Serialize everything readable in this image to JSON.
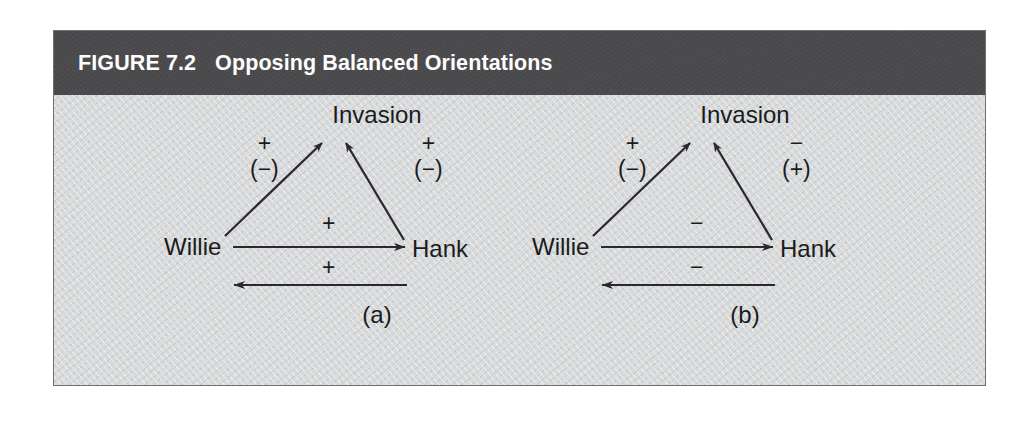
{
  "figure": {
    "number_label": "FIGURE 7.2",
    "title": "Opposing Balanced Orientations",
    "header_bg": "#4a4a4c",
    "body_bg": "#d9dadb",
    "ink": "#1b1b1b",
    "border": "#6f7173"
  },
  "panels": [
    {
      "id": "a",
      "caption": "(a)",
      "nodes": {
        "apex": "Invasion",
        "left": "Willie",
        "right": "Hank"
      },
      "edges": {
        "left_diagonal": {
          "outer": "+",
          "inner": "(−)",
          "direction": "willie-to-invasion"
        },
        "right_diagonal": {
          "outer": "+",
          "inner": "(−)",
          "direction": "hank-to-invasion"
        },
        "base_forward": {
          "sign": "+",
          "direction": "willie-to-hank"
        },
        "base_backward": {
          "sign": "+",
          "direction": "hank-to-willie"
        }
      }
    },
    {
      "id": "b",
      "caption": "(b)",
      "nodes": {
        "apex": "Invasion",
        "left": "Willie",
        "right": "Hank"
      },
      "edges": {
        "left_diagonal": {
          "outer": "+",
          "inner": "(−)",
          "direction": "willie-to-invasion"
        },
        "right_diagonal": {
          "outer": "−",
          "inner": "(+)",
          "direction": "hank-to-invasion"
        },
        "base_forward": {
          "sign": "−",
          "direction": "willie-to-hank"
        },
        "base_backward": {
          "sign": "−",
          "direction": "hank-to-willie"
        }
      }
    }
  ]
}
